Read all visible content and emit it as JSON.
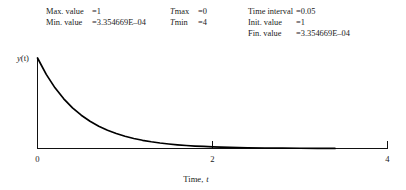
{
  "params": {
    "columns": [
      {
        "name": "stats-column",
        "rows": [
          {
            "label": "Max. value",
            "eq": "=",
            "value": "1"
          },
          {
            "label": "Min. value",
            "eq": "=",
            "value": "3.354669E‒04"
          }
        ]
      },
      {
        "name": "time-range-column",
        "rows": [
          {
            "label": "Tmax",
            "eq": "=",
            "value": "0",
            "label_italic_prefix": "T"
          },
          {
            "label": "Tmin",
            "eq": "=",
            "value": "4",
            "label_italic_prefix": "T"
          }
        ]
      },
      {
        "name": "integration-column",
        "rows": [
          {
            "label": "Time interval",
            "eq": "=",
            "value": "0.05"
          },
          {
            "label": "Init. value",
            "eq": "=",
            "value": "1"
          },
          {
            "label": "Fin. value",
            "eq": "=",
            "value": "3.354669E‒04"
          }
        ]
      }
    ]
  },
  "chart_data": {
    "type": "line",
    "title": "",
    "xlabel": "Time, t",
    "xlabel_plain": "Time,",
    "xlabel_italic": "t",
    "ylabel": "y(t)",
    "ylabel_italic": "y",
    "ylabel_rest": "(t)",
    "xlim": [
      0,
      4
    ],
    "ylim": [
      0,
      1
    ],
    "xticks": [
      0,
      2,
      4
    ],
    "xticklabels": [
      "0",
      "2",
      "4"
    ],
    "yticks": [],
    "yticklabels": [],
    "grid": false,
    "legend": false,
    "series": [
      {
        "name": "y(t) = exp(-2t)",
        "x": [
          0,
          0.1,
          0.2,
          0.3,
          0.4,
          0.5,
          0.6,
          0.7,
          0.8,
          0.9,
          1.0,
          1.1,
          1.2,
          1.3,
          1.4,
          1.5,
          1.6,
          1.7,
          1.8,
          1.9,
          2.0,
          2.2,
          2.4,
          2.6,
          2.8,
          3.0,
          3.2,
          3.4
        ],
        "y": [
          1.0,
          0.8187,
          0.6703,
          0.5488,
          0.4493,
          0.3679,
          0.3012,
          0.2466,
          0.2019,
          0.1653,
          0.1353,
          0.1108,
          0.0907,
          0.0743,
          0.0608,
          0.0498,
          0.0408,
          0.0334,
          0.0273,
          0.0224,
          0.0183,
          0.0123,
          0.0082,
          0.0055,
          0.0037,
          0.0025,
          0.0017,
          0.0011
        ]
      }
    ]
  },
  "colors": {
    "curve": "#000000",
    "axis": "#111111",
    "text": "#1a1a1a",
    "background": "#ffffff"
  }
}
